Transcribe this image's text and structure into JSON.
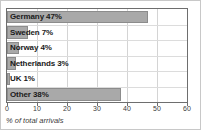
{
  "chart_data": {
    "type": "bar",
    "orientation": "horizontal",
    "title": "",
    "xlabel": "% of total arrivals",
    "ylabel": "",
    "xlim": [
      0,
      60
    ],
    "xticks": [
      0,
      10,
      20,
      30,
      40,
      50,
      60
    ],
    "xtick_labels": [
      "0",
      "10",
      "20",
      "30",
      "40",
      "50",
      "60"
    ],
    "grid": true,
    "legend": false,
    "categories": [
      "Germany",
      "Sweden",
      "Norway",
      "Netherlands",
      "UK",
      "Other"
    ],
    "values": [
      47,
      7,
      4,
      3,
      1,
      38
    ],
    "bar_labels": [
      "Germany 47%",
      "Sweden 7%",
      "Norway 4%",
      "Netherlands 3%",
      "UK 1%",
      "Other 38%"
    ],
    "colors": {
      "bar_fill": "#a9a9a9",
      "bar_edge": "#8c8c8c",
      "grid": "#d4d4d4",
      "axis": "#6e6e6e",
      "text": "#1a1a1a",
      "background": "#ffffff",
      "frame": "#c8c8c8"
    }
  }
}
